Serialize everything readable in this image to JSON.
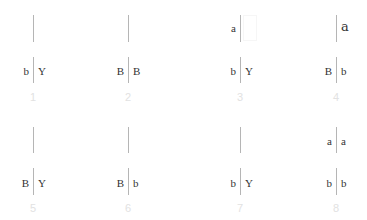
{
  "diagram": {
    "panels": [
      {
        "number": "1",
        "top": {
          "left": "",
          "right": ""
        },
        "bottom": {
          "left": "b",
          "right": "Y"
        }
      },
      {
        "number": "2",
        "top": {
          "left": "",
          "right": ""
        },
        "bottom": {
          "left": "B",
          "right": "B"
        }
      },
      {
        "number": "3",
        "top": {
          "left": "a",
          "right": ""
        },
        "bottom": {
          "left": "b",
          "right": "Y"
        }
      },
      {
        "number": "4",
        "top": {
          "left": "",
          "right": "a"
        },
        "bottom": {
          "left": "B",
          "right": "b"
        }
      },
      {
        "number": "5",
        "top": {
          "left": "",
          "right": ""
        },
        "bottom": {
          "left": "B",
          "right": "Y"
        }
      },
      {
        "number": "6",
        "top": {
          "left": "",
          "right": ""
        },
        "bottom": {
          "left": "B",
          "right": "b"
        }
      },
      {
        "number": "7",
        "top": {
          "left": "",
          "right": ""
        },
        "bottom": {
          "left": "b",
          "right": "Y"
        }
      },
      {
        "number": "8",
        "top": {
          "left": "a",
          "right": "a"
        },
        "bottom": {
          "left": "b",
          "right": "b"
        }
      }
    ]
  },
  "colors": {
    "line": "#b5b5b5",
    "text": "#333333",
    "number": "#e2e2e2",
    "background": "#ffffff"
  }
}
